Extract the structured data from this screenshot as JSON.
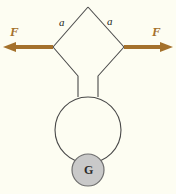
{
  "figure": {
    "background_color": "#fdfdf2",
    "wire_color": "#4a4a4a",
    "arrow_color": "#a4712c",
    "ball_fill": "#c9c9c9",
    "ball_stroke": "#6e6e6e",
    "labels": {
      "force_left": "F",
      "force_right": "F",
      "side_left": "a",
      "side_right": "a",
      "ball": "G"
    },
    "geometry": {
      "diamond_top": [
        88,
        7
      ],
      "diamond_left": [
        53,
        47
      ],
      "diamond_right": [
        124,
        47
      ],
      "neck_left_bend": [
        78,
        80
      ],
      "neck_right_bend": [
        98,
        80
      ],
      "ring_center": [
        88,
        130
      ],
      "ring_radius": 33,
      "ball_center": [
        88,
        170
      ],
      "ball_radius": 16,
      "arrow_left_tip": [
        4,
        47
      ],
      "arrow_right_tip": [
        172,
        47
      ]
    }
  }
}
